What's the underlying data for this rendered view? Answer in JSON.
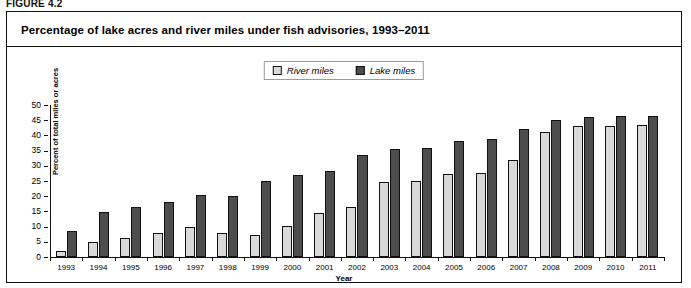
{
  "figure": {
    "label": "FIGURE 4.2",
    "title": "Percentage of lake acres and river miles under fish advisories, 1993–2011"
  },
  "legend": {
    "position": "top-center",
    "entries": [
      {
        "label": "River miles",
        "color": "#d9d9d9"
      },
      {
        "label": "Lake miles",
        "color": "#4d4d4d"
      }
    ]
  },
  "chart_data": {
    "type": "bar",
    "title": "Percentage of lake acres and river miles under fish advisories, 1993–2011",
    "xlabel": "Year",
    "ylabel": "Percent of total miles or acres",
    "ylim": [
      0,
      50
    ],
    "ytick_step": 5,
    "yticks": [
      0,
      5,
      10,
      15,
      20,
      25,
      30,
      35,
      40,
      45,
      50
    ],
    "grid": false,
    "categories": [
      "1993",
      "1994",
      "1995",
      "1996",
      "1997",
      "1998",
      "1999",
      "2000",
      "2001",
      "2002",
      "2003",
      "2004",
      "2005",
      "2006",
      "2007",
      "2008",
      "2009",
      "2010",
      "2011"
    ],
    "series": [
      {
        "name": "River miles",
        "color": "#d9d9d9",
        "values": [
          2.0,
          5.1,
          6.1,
          8.0,
          9.9,
          7.9,
          7.3,
          10.1,
          14.5,
          16.3,
          24.8,
          25.0,
          27.4,
          27.6,
          32.0,
          41.0,
          43.0,
          43.1,
          43.4
        ]
      },
      {
        "name": "Lake miles",
        "color": "#4d4d4d",
        "values": [
          8.5,
          14.7,
          16.5,
          18.0,
          20.5,
          20.1,
          25.0,
          26.9,
          28.2,
          33.5,
          35.6,
          36.0,
          38.1,
          38.8,
          42.1,
          45.2,
          45.9,
          46.3,
          46.5
        ]
      }
    ]
  }
}
